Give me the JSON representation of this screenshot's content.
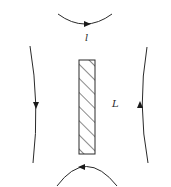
{
  "diagram": {
    "labels": {
      "top_arc": "l",
      "rod_length": "L"
    },
    "elements": {
      "rod": {
        "shape": "hatched-rectangle",
        "x": 79,
        "y": 60,
        "width": 16,
        "height": 94,
        "hatch": "diagonal"
      },
      "top_arc": {
        "direction": "right",
        "curvature": "concave-up"
      },
      "bottom_arc": {
        "direction": "left",
        "curvature": "concave-down"
      },
      "left_line": {
        "direction": "down"
      },
      "right_line": {
        "direction": "up"
      }
    },
    "colors": {
      "stroke": "#2a2a2a",
      "background": "#ffffff"
    }
  }
}
